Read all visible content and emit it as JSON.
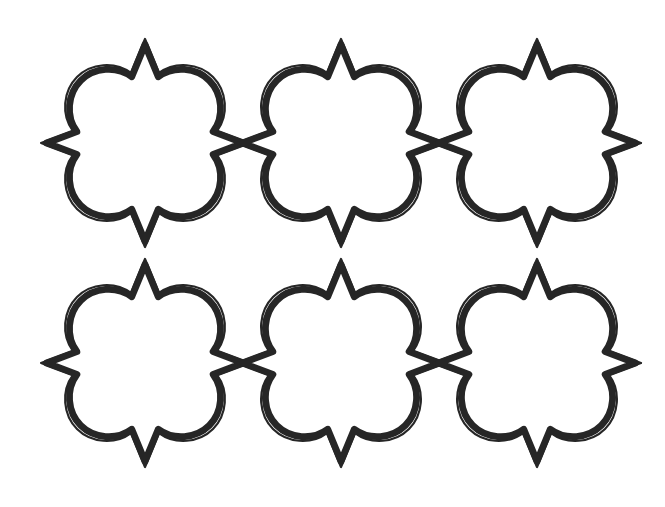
{
  "artwork": {
    "title": "Octofoil Lattice Pattern",
    "description": "Hand-drawn ink pattern of six eight-lobed Moorish octofoil medallions in a two-row by three-column lattice, each drawn with a double outline and joined to its neighbours at sharp points.",
    "medium": "ink line drawing",
    "background_color": "#ffffff",
    "ink_color": "#262626",
    "interior_color": "#ffffff",
    "canvas": {
      "width": 665,
      "height": 507
    }
  },
  "chart_data": {
    "type": "scatter",
    "xlabel": "",
    "ylabel": "",
    "xlim": [
      0,
      665
    ],
    "ylim": [
      0,
      507
    ],
    "grid": false,
    "legend": "none",
    "categories": [
      "row-1-col-1",
      "row-1-col-2",
      "row-1-col-3",
      "row-2-col-1",
      "row-2-col-2",
      "row-2-col-3"
    ],
    "x": [
      145,
      341,
      537,
      145,
      341,
      537
    ],
    "y": [
      143,
      143,
      143,
      363,
      363,
      363
    ],
    "values": [
      1,
      1,
      1,
      1,
      1,
      1
    ]
  },
  "pattern": {
    "shape_name": "octofoil",
    "lobe_count": 8,
    "point_count": 4,
    "rows": 2,
    "columns": 3,
    "total_motifs": 6,
    "outline_style": "double line",
    "outer_stroke_width": 2.2,
    "inner_stroke_width": 7.2,
    "gap_between_lines": 3.4,
    "column_spacing": 196,
    "row_spacing": 220,
    "radius_point": 104,
    "radius_lobe": 90,
    "junction_style": "point-to-point contact",
    "junctions_horizontal": [
      {
        "x": 243,
        "y": 143
      },
      {
        "x": 439,
        "y": 143
      },
      {
        "x": 243,
        "y": 363
      },
      {
        "x": 439,
        "y": 363
      }
    ],
    "junctions_vertical": [
      {
        "x": 145,
        "y": 253
      },
      {
        "x": 341,
        "y": 253
      },
      {
        "x": 537,
        "y": 253
      }
    ],
    "motifs": [
      {
        "id": "motif-r1c1",
        "row": 1,
        "column": 1,
        "cx": 145,
        "cy": 143,
        "rotation": 0,
        "scale": 1.0
      },
      {
        "id": "motif-r1c2",
        "row": 1,
        "column": 2,
        "cx": 341,
        "cy": 143,
        "rotation": 0,
        "scale": 1.0
      },
      {
        "id": "motif-r1c3",
        "row": 1,
        "column": 3,
        "cx": 537,
        "cy": 143,
        "rotation": 0,
        "scale": 1.0
      },
      {
        "id": "motif-r2c1",
        "row": 2,
        "column": 1,
        "cx": 145,
        "cy": 363,
        "rotation": 0,
        "scale": 1.0
      },
      {
        "id": "motif-r2c2",
        "row": 2,
        "column": 2,
        "cx": 341,
        "cy": 363,
        "rotation": 0,
        "scale": 1.0
      },
      {
        "id": "motif-r2c3",
        "row": 2,
        "column": 3,
        "cx": 537,
        "cy": 363,
        "rotation": 0,
        "scale": 1.0
      }
    ],
    "bounds": {
      "left": 42,
      "right": 625,
      "top": 33,
      "bottom": 472
    }
  }
}
